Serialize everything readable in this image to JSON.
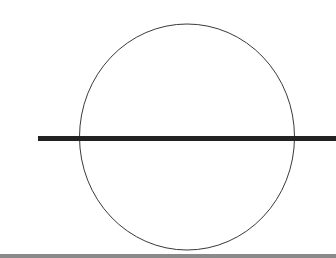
{
  "diagram": {
    "shapes": [
      {
        "kind": "circle",
        "stroke": "#3a3a3a"
      },
      {
        "kind": "horizontal-line",
        "stroke": "#222222"
      },
      {
        "kind": "bottom-border",
        "stroke": "#8a8a8a"
      }
    ]
  }
}
